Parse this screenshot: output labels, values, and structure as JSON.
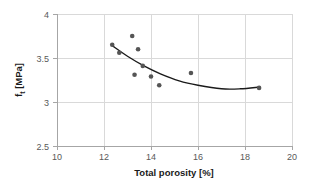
{
  "chart_data": {
    "type": "scatter",
    "title": "",
    "xlabel": "Total porosity [%]",
    "ylabel": "f_t [MPa]",
    "ylabel_base": "f",
    "ylabel_subscript": "t",
    "ylabel_unit": "[MPa]",
    "xlim": [
      10,
      20
    ],
    "ylim": [
      2.5,
      4
    ],
    "xticks": [
      10,
      12,
      14,
      16,
      18,
      20
    ],
    "xtick_labels": [
      "10",
      "12",
      "14",
      "16",
      "18",
      "20"
    ],
    "yticks": [
      2.5,
      3,
      3.5,
      4
    ],
    "ytick_labels": [
      "2.5",
      "3",
      "3.5",
      "4"
    ],
    "grid": true,
    "grid_axis": "both",
    "legend": false,
    "legend_position": "none",
    "marker": "circle",
    "marker_color": "#555555",
    "trendline_color": "#1a1a1a",
    "grid_color": "#d9d9d9",
    "axis_color": "#a6a6a6",
    "background_color": "#ffffff",
    "points": [
      {
        "x": 12.35,
        "y": 3.65
      },
      {
        "x": 12.65,
        "y": 3.56
      },
      {
        "x": 13.2,
        "y": 3.75
      },
      {
        "x": 13.3,
        "y": 3.31
      },
      {
        "x": 13.45,
        "y": 3.6
      },
      {
        "x": 13.65,
        "y": 3.41
      },
      {
        "x": 14.0,
        "y": 3.29
      },
      {
        "x": 14.35,
        "y": 3.19
      },
      {
        "x": 15.7,
        "y": 3.33
      },
      {
        "x": 18.6,
        "y": 3.16
      }
    ],
    "series": [
      {
        "name": "measured",
        "type": "scatter",
        "x": [
          12.35,
          12.65,
          13.2,
          13.3,
          13.45,
          13.65,
          14.0,
          14.35,
          15.7,
          18.6
        ],
        "values": [
          3.65,
          3.56,
          3.75,
          3.31,
          3.6,
          3.41,
          3.29,
          3.19,
          3.33,
          3.16
        ]
      },
      {
        "name": "trend",
        "type": "line",
        "x": [
          12.35,
          13.0,
          13.7,
          14.4,
          15.2,
          16.0,
          17.0,
          17.8,
          18.6
        ],
        "values": [
          3.64,
          3.52,
          3.41,
          3.32,
          3.24,
          3.19,
          3.15,
          3.15,
          3.17
        ]
      }
    ],
    "annotations": []
  }
}
